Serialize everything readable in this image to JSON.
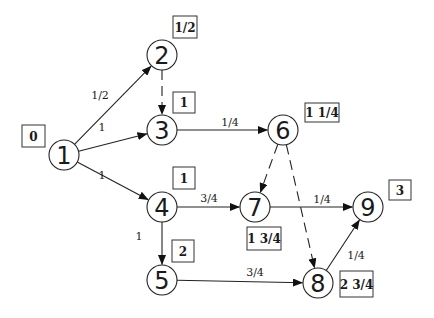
{
  "diagram": {
    "type": "activity-network",
    "nodes": [
      {
        "id": "1",
        "label": "1",
        "x": 64,
        "y": 155,
        "time": "0",
        "box": {
          "x": 22,
          "y": 125,
          "w": 23,
          "h": 22
        }
      },
      {
        "id": "2",
        "label": "2",
        "x": 162,
        "y": 55,
        "time": "1/2",
        "box": {
          "x": 173,
          "y": 16,
          "w": 24,
          "h": 22
        }
      },
      {
        "id": "3",
        "label": "3",
        "x": 162,
        "y": 130,
        "time": "1",
        "box": {
          "x": 173,
          "y": 92,
          "w": 22,
          "h": 21
        }
      },
      {
        "id": "4",
        "label": "4",
        "x": 162,
        "y": 207,
        "time": "1",
        "box": {
          "x": 173,
          "y": 167,
          "w": 22,
          "h": 22
        }
      },
      {
        "id": "5",
        "label": "5",
        "x": 162,
        "y": 280,
        "time": "2",
        "box": {
          "x": 172,
          "y": 240,
          "w": 22,
          "h": 22
        }
      },
      {
        "id": "6",
        "label": "6",
        "x": 283,
        "y": 130,
        "time": "1 1/4",
        "box": {
          "x": 305,
          "y": 103,
          "w": 34,
          "h": 19
        }
      },
      {
        "id": "7",
        "label": "7",
        "x": 255,
        "y": 207,
        "time": "1 3/4",
        "box": {
          "x": 247,
          "y": 227,
          "w": 34,
          "h": 23
        }
      },
      {
        "id": "8",
        "label": "8",
        "x": 318,
        "y": 283,
        "time": "2 3/4",
        "box": {
          "x": 340,
          "y": 271,
          "w": 33,
          "h": 26
        }
      },
      {
        "id": "9",
        "label": "9",
        "x": 368,
        "y": 207,
        "time": "3",
        "box": {
          "x": 389,
          "y": 180,
          "w": 22,
          "h": 20
        }
      }
    ],
    "edges": [
      {
        "from": "1",
        "to": "2",
        "weight": "1/2",
        "dashed": false,
        "label_x": 100,
        "label_y": 95
      },
      {
        "from": "1",
        "to": "3",
        "weight": "1",
        "dashed": false,
        "label_x": 102,
        "label_y": 127
      },
      {
        "from": "1",
        "to": "4",
        "weight": "1",
        "dashed": false,
        "label_x": 102,
        "label_y": 175
      },
      {
        "from": "2",
        "to": "3",
        "weight": "",
        "dashed": true,
        "label_x": 0,
        "label_y": 0
      },
      {
        "from": "3",
        "to": "6",
        "weight": "1/4",
        "dashed": false,
        "label_x": 230,
        "label_y": 122
      },
      {
        "from": "4",
        "to": "7",
        "weight": "3/4",
        "dashed": false,
        "label_x": 209,
        "label_y": 198
      },
      {
        "from": "4",
        "to": "5",
        "weight": "1",
        "dashed": false,
        "label_x": 139,
        "label_y": 236
      },
      {
        "from": "6",
        "to": "7",
        "weight": "",
        "dashed": true,
        "label_x": 0,
        "label_y": 0
      },
      {
        "from": "6",
        "to": "8",
        "weight": "",
        "dashed": true,
        "label_x": 0,
        "label_y": 0
      },
      {
        "from": "7",
        "to": "9",
        "weight": "1/4",
        "dashed": false,
        "label_x": 322,
        "label_y": 199
      },
      {
        "from": "5",
        "to": "8",
        "weight": "3/4",
        "dashed": false,
        "label_x": 255,
        "label_y": 272
      },
      {
        "from": "8",
        "to": "9",
        "weight": "1/4",
        "dashed": false,
        "label_x": 356,
        "label_y": 255
      }
    ],
    "node_radius": 15,
    "colors": {
      "stroke": "#222222",
      "background": "#ffffff",
      "text": "#1a1a1a"
    }
  }
}
